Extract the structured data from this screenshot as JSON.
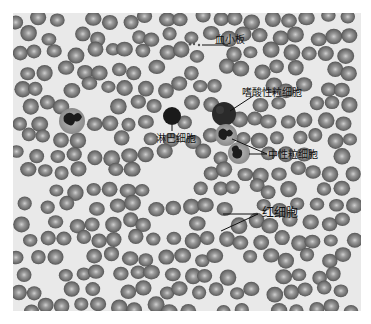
{
  "figure": {
    "type": "blood smear micrograph",
    "labels": {
      "platelet": "血小板",
      "eosinophil": "嗜酸性粒细胞",
      "lymphocyte": "淋巴细胞",
      "neutrophil": "中性粒细胞",
      "red_blood_cell": "红细胞"
    }
  }
}
